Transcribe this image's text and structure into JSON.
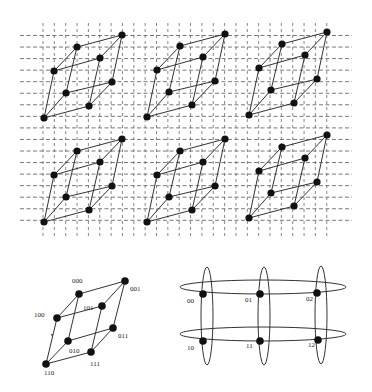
{
  "figure": {
    "top_panel": {
      "description": "3D mesh grid with six embedded 3-cube (hypercube) graphs arranged in 2 rows x 3 columns",
      "grid": {
        "x_start": 43,
        "x_step": 11.35,
        "x_count": 27,
        "v_y1": 23,
        "v_y2": 236,
        "y_start": 35.5,
        "y_step": 11.55,
        "y_count": 17,
        "h_x1": 20,
        "h_x2": 352,
        "color": "#555555"
      },
      "cube_template": {
        "nodes": [
          [
            122,
            35
          ],
          [
            77,
            47
          ],
          [
            100,
            58
          ],
          [
            54,
            71
          ],
          [
            112,
            82
          ],
          [
            66,
            93
          ],
          [
            89,
            106
          ],
          [
            44,
            118
          ]
        ],
        "edges": [
          [
            0,
            1
          ],
          [
            0,
            2
          ],
          [
            0,
            4
          ],
          [
            1,
            3
          ],
          [
            1,
            5
          ],
          [
            2,
            3
          ],
          [
            2,
            6
          ],
          [
            4,
            5
          ],
          [
            4,
            6
          ],
          [
            3,
            7
          ],
          [
            5,
            7
          ],
          [
            6,
            7
          ]
        ]
      },
      "cube_offsets": [
        [
          0,
          0
        ],
        [
          103,
          -1
        ],
        [
          205,
          -3
        ],
        [
          0,
          104
        ],
        [
          103,
          104
        ],
        [
          205,
          100
        ]
      ]
    },
    "hypercube": {
      "nodes": [
        {
          "label": "000",
          "x": 79,
          "y": 294,
          "lx": 72,
          "ly": 283
        },
        {
          "label": "001",
          "x": 125,
          "y": 281,
          "lx": 130,
          "ly": 291
        },
        {
          "label": "100",
          "x": 57,
          "y": 318,
          "lx": 34,
          "ly": 317
        },
        {
          "label": "101",
          "x": 102,
          "y": 306,
          "lx": 83,
          "ly": 310
        },
        {
          "label": "010",
          "x": 68,
          "y": 341,
          "lx": 69,
          "ly": 353
        },
        {
          "label": "011",
          "x": 113,
          "y": 328,
          "lx": 118,
          "ly": 338
        },
        {
          "label": "110",
          "x": 46,
          "y": 364,
          "lx": 44,
          "ly": 375
        },
        {
          "label": "111",
          "x": 91,
          "y": 352,
          "lx": 90,
          "ly": 366
        }
      ],
      "edges": [
        [
          1,
          0
        ],
        [
          1,
          3
        ],
        [
          1,
          5
        ],
        [
          0,
          2
        ],
        [
          0,
          4
        ],
        [
          3,
          2
        ],
        [
          3,
          7
        ],
        [
          5,
          4
        ],
        [
          5,
          7
        ],
        [
          2,
          6
        ],
        [
          4,
          6
        ],
        [
          7,
          6
        ]
      ]
    },
    "torus": {
      "nodes": [
        {
          "label": "00",
          "x": 203,
          "y": 294,
          "lx": 187,
          "ly": 303
        },
        {
          "label": "01",
          "x": 260,
          "y": 294,
          "lx": 245,
          "ly": 302
        },
        {
          "label": "02",
          "x": 317,
          "y": 293,
          "lx": 306,
          "ly": 301
        },
        {
          "label": "10",
          "x": 203,
          "y": 341,
          "lx": 187,
          "ly": 350
        },
        {
          "label": "11",
          "x": 260,
          "y": 341,
          "lx": 246,
          "ly": 348
        },
        {
          "label": "12",
          "x": 318,
          "y": 340,
          "lx": 308,
          "ly": 347
        }
      ],
      "row_rings": [
        {
          "cx": 263,
          "cy": 287,
          "rx": 83,
          "ry": 7
        },
        {
          "cx": 263,
          "cy": 334,
          "rx": 83,
          "ry": 7
        }
      ],
      "col_rings": [
        {
          "cx": 207,
          "cy": 316,
          "rx": 6,
          "ry": 49
        },
        {
          "cx": 264,
          "cy": 316,
          "rx": 6,
          "ry": 49
        },
        {
          "cx": 321,
          "cy": 315,
          "rx": 6,
          "ry": 49
        }
      ]
    },
    "colors": {
      "line": "#333333",
      "node": "#111111",
      "grid": "#666666",
      "background": "#ffffff"
    }
  }
}
